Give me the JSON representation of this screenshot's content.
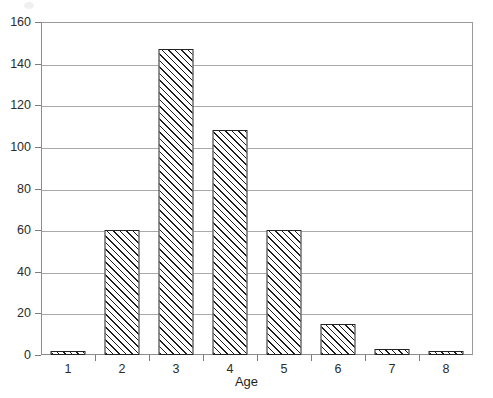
{
  "chart_data": {
    "type": "bar",
    "title": "",
    "subtitle": "",
    "xlabel": "Age",
    "ylabel": "",
    "categories": [
      "1",
      "2",
      "3",
      "4",
      "5",
      "6",
      "7",
      "8"
    ],
    "values": [
      2,
      60,
      147,
      108,
      60,
      15,
      3,
      2
    ],
    "series": [
      {
        "name": "",
        "values": [
          2,
          60,
          147,
          108,
          60,
          15,
          3,
          2
        ]
      }
    ],
    "ylim": [
      0,
      160
    ],
    "ytick_values": [
      0,
      20,
      40,
      60,
      80,
      100,
      120,
      140,
      160
    ],
    "ytick_labels": [
      "0",
      "20",
      "40",
      "60",
      "80",
      "100",
      "120",
      "140",
      "160"
    ],
    "xtick_labels": [
      "1",
      "2",
      "3",
      "4",
      "5",
      "6",
      "7",
      "8"
    ],
    "grid": "horizontal",
    "legend": "none",
    "bar_fill": "white-diagonal-hatch",
    "bar_edge_color": "#232323",
    "gridline_color": "#a9a9a9",
    "axis_color": "#8c8c8c",
    "plot_background": "#ffffff"
  }
}
